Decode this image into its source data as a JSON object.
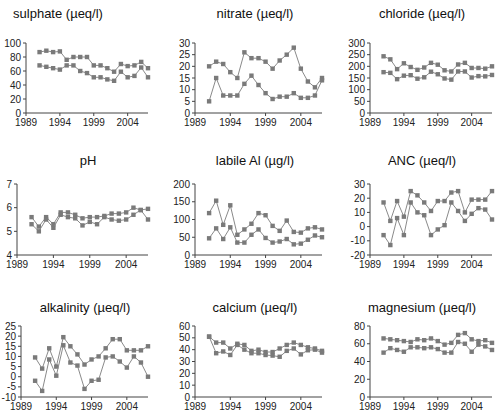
{
  "style": {
    "axis_color": "#444444",
    "line_color": "#8a8a8a",
    "marker_color": "#7a7a7a"
  },
  "chart_data": [
    {
      "id": "sulphate",
      "type": "line",
      "title": "sulphate (µeq/l)",
      "xlabel": "",
      "ylabel": "",
      "xlim": [
        1989,
        2007
      ],
      "ylim": [
        0,
        100
      ],
      "yticks": [
        0,
        20,
        40,
        60,
        80,
        100
      ],
      "xticks": [
        1989,
        1994,
        1999,
        2004
      ],
      "grid": false,
      "x": [
        1991,
        1992,
        1993,
        1994,
        1995,
        1996,
        1997,
        1998,
        1999,
        2000,
        2001,
        2002,
        2003,
        2004,
        2005,
        2006,
        2007
      ],
      "series": [
        {
          "name": "upper",
          "values": [
            87,
            89,
            87,
            88,
            76,
            80,
            80,
            80,
            68,
            68,
            64,
            59,
            70,
            67,
            68,
            73,
            64
          ]
        },
        {
          "name": "lower",
          "values": [
            68,
            66,
            64,
            62,
            68,
            68,
            60,
            57,
            51,
            51,
            48,
            46,
            59,
            51,
            53,
            65,
            51
          ]
        }
      ]
    },
    {
      "id": "nitrate",
      "type": "line",
      "title": "nitrate (µeq/l)",
      "xlabel": "",
      "ylabel": "",
      "xlim": [
        1989,
        2007
      ],
      "ylim": [
        0,
        30
      ],
      "yticks": [
        0,
        5,
        10,
        15,
        20,
        25,
        30
      ],
      "xticks": [
        1989,
        1994,
        1999,
        2004
      ],
      "grid": false,
      "x": [
        1991,
        1992,
        1993,
        1994,
        1995,
        1996,
        1997,
        1998,
        1999,
        2000,
        2001,
        2002,
        2003,
        2004,
        2005,
        2006,
        2007
      ],
      "series": [
        {
          "name": "upper",
          "values": [
            20,
            22,
            21,
            17.5,
            15,
            26,
            23.5,
            23.5,
            22,
            19,
            22.5,
            25,
            28,
            19,
            13.5,
            11,
            15
          ]
        },
        {
          "name": "lower",
          "values": [
            5,
            15,
            7.5,
            7.5,
            7.5,
            12.5,
            16,
            12,
            8.5,
            6,
            7,
            7,
            8.5,
            6.5,
            6.5,
            7.5,
            14
          ]
        }
      ]
    },
    {
      "id": "chloride",
      "type": "line",
      "title": "chloride (µeq/l)",
      "xlabel": "",
      "ylabel": "",
      "xlim": [
        1989,
        2007
      ],
      "ylim": [
        0,
        300
      ],
      "yticks": [
        0,
        50,
        100,
        150,
        200,
        250,
        300
      ],
      "xticks": [
        1989,
        1994,
        1999,
        2004
      ],
      "grid": false,
      "x": [
        1991,
        1992,
        1993,
        1994,
        1995,
        1996,
        1997,
        1998,
        1999,
        2000,
        2001,
        2002,
        2003,
        2004,
        2005,
        2006,
        2007
      ],
      "series": [
        {
          "name": "upper",
          "values": [
            243,
            230,
            188,
            213,
            197,
            185,
            195,
            215,
            207,
            183,
            178,
            208,
            215,
            193,
            193,
            190,
            200
          ]
        },
        {
          "name": "lower",
          "values": [
            175,
            172,
            145,
            160,
            162,
            147,
            153,
            177,
            166,
            148,
            143,
            178,
            178,
            152,
            158,
            157,
            163
          ]
        }
      ]
    },
    {
      "id": "ph",
      "type": "line",
      "title": "pH",
      "xlabel": "",
      "ylabel": "",
      "xlim": [
        1989,
        2007
      ],
      "ylim": [
        4,
        7
      ],
      "yticks": [
        4,
        5,
        6,
        7
      ],
      "xticks": [
        1989,
        1994,
        1999,
        2004
      ],
      "grid": false,
      "x": [
        1991,
        1992,
        1993,
        1994,
        1995,
        1996,
        1997,
        1998,
        1999,
        2000,
        2001,
        2002,
        2003,
        2004,
        2005,
        2006,
        2007
      ],
      "series": [
        {
          "name": "upper",
          "values": [
            5.6,
            5.2,
            5.6,
            5.3,
            5.8,
            5.8,
            5.7,
            5.55,
            5.6,
            5.6,
            5.65,
            5.75,
            5.75,
            5.8,
            6.0,
            5.9,
            5.95
          ]
        },
        {
          "name": "lower",
          "values": [
            5.3,
            5.0,
            5.5,
            5.15,
            5.7,
            5.6,
            5.55,
            5.25,
            5.4,
            5.3,
            5.6,
            5.5,
            5.45,
            5.5,
            5.7,
            5.9,
            5.5
          ]
        }
      ]
    },
    {
      "id": "labile_al",
      "type": "line",
      "title": "labile Al (µg/l)",
      "xlabel": "",
      "ylabel": "",
      "xlim": [
        1989,
        2007
      ],
      "ylim": [
        0,
        200
      ],
      "yticks": [
        0,
        50,
        100,
        150,
        200
      ],
      "xticks": [
        1989,
        1994,
        1999,
        2004
      ],
      "grid": false,
      "x": [
        1991,
        1992,
        1993,
        1994,
        1995,
        1996,
        1997,
        1998,
        1999,
        2000,
        2001,
        2002,
        2003,
        2004,
        2005,
        2006,
        2007
      ],
      "series": [
        {
          "name": "upper",
          "values": [
            118,
            153,
            85,
            140,
            57,
            72,
            88,
            118,
            112,
            82,
            68,
            97,
            65,
            63,
            75,
            78,
            72
          ]
        },
        {
          "name": "lower",
          "values": [
            47,
            75,
            45,
            78,
            35,
            35,
            57,
            72,
            48,
            35,
            38,
            45,
            30,
            32,
            43,
            55,
            50
          ]
        }
      ]
    },
    {
      "id": "anc",
      "type": "line",
      "title": "ANC (µeq/l)",
      "xlabel": "",
      "ylabel": "",
      "xlim": [
        1989,
        2007
      ],
      "ylim": [
        -20,
        30
      ],
      "yticks": [
        -20,
        -10,
        0,
        10,
        20,
        30
      ],
      "xticks": [
        1989,
        1994,
        1999,
        2004
      ],
      "grid": false,
      "x": [
        1991,
        1992,
        1993,
        1994,
        1995,
        1996,
        1997,
        1998,
        1999,
        2000,
        2001,
        2002,
        2003,
        2004,
        2005,
        2006,
        2007
      ],
      "series": [
        {
          "name": "upper",
          "values": [
            17,
            4,
            18,
            7,
            25,
            22,
            17,
            11,
            18,
            18,
            24,
            25,
            10,
            19,
            19,
            19,
            25
          ]
        },
        {
          "name": "lower",
          "values": [
            -6,
            -13,
            6,
            -6,
            17,
            10,
            8,
            -6,
            -2,
            1,
            17,
            11,
            4,
            9,
            13,
            12,
            5
          ]
        }
      ]
    },
    {
      "id": "alkalinity",
      "type": "line",
      "title": "alkalinity (µeq/l)",
      "xlabel": "",
      "ylabel": "",
      "xlim": [
        1989,
        2007
      ],
      "ylim": [
        -10,
        25
      ],
      "yticks": [
        -10,
        -5,
        0,
        5,
        10,
        15,
        20,
        25
      ],
      "xticks": [
        1989,
        1994,
        1999,
        2004
      ],
      "grid": false,
      "x": [
        1991,
        1992,
        1993,
        1994,
        1995,
        1996,
        1997,
        1998,
        1999,
        2000,
        2001,
        2002,
        2003,
        2004,
        2005,
        2006,
        2007
      ],
      "series": [
        {
          "name": "upper",
          "values": [
            9.5,
            4,
            14,
            5,
            19.5,
            15,
            11,
            6,
            8.5,
            10,
            14,
            18.5,
            18.5,
            13,
            13,
            13,
            15
          ]
        },
        {
          "name": "lower",
          "values": [
            -2,
            -7,
            8.5,
            0.5,
            15.5,
            7,
            5.5,
            -6,
            -2,
            -1.5,
            9.5,
            10,
            7.5,
            4.5,
            10,
            7,
            0
          ]
        }
      ]
    },
    {
      "id": "calcium",
      "type": "line",
      "title": "calcium (µeq/l)",
      "xlabel": "",
      "ylabel": "",
      "xlim": [
        1989,
        2007
      ],
      "ylim": [
        0,
        60
      ],
      "yticks": [
        0,
        10,
        20,
        30,
        40,
        50,
        60
      ],
      "xticks": [
        1989,
        1994,
        1999,
        2004
      ],
      "grid": false,
      "x": [
        1991,
        1992,
        1993,
        1994,
        1995,
        1996,
        1997,
        1998,
        1999,
        2000,
        2001,
        2002,
        2003,
        2004,
        2005,
        2006,
        2007
      ],
      "series": [
        {
          "name": "upper",
          "values": [
            51,
            46,
            46,
            41,
            45,
            44,
            39,
            40,
            38,
            38,
            41,
            44,
            46,
            44,
            42,
            41,
            39
          ]
        },
        {
          "name": "lower",
          "values": [
            51,
            37,
            38.5,
            35.5,
            44,
            40,
            37,
            37,
            35.5,
            35,
            34,
            39,
            41,
            36,
            39.5,
            40,
            37.5
          ]
        }
      ]
    },
    {
      "id": "magnesium",
      "type": "line",
      "title": "magnesium (µeq/l)",
      "xlabel": "",
      "ylabel": "",
      "xlim": [
        1989,
        2007
      ],
      "ylim": [
        0,
        80
      ],
      "yticks": [
        0,
        20,
        40,
        60,
        80
      ],
      "xticks": [
        1989,
        1994,
        1999,
        2004
      ],
      "grid": false,
      "x": [
        1991,
        1992,
        1993,
        1994,
        1995,
        1996,
        1997,
        1998,
        1999,
        2000,
        2001,
        2002,
        2003,
        2004,
        2005,
        2006,
        2007
      ],
      "series": [
        {
          "name": "upper",
          "values": [
            66,
            65,
            64,
            63,
            62,
            65,
            64,
            66,
            63,
            59,
            61,
            70,
            72,
            65,
            63,
            64,
            61
          ]
        },
        {
          "name": "lower",
          "values": [
            50,
            55,
            53,
            51,
            56,
            56,
            55,
            56,
            54,
            50,
            50,
            62,
            60,
            51,
            59,
            57,
            53
          ]
        }
      ]
    }
  ],
  "layout": [
    {
      "title_x": 58,
      "title_y": 6,
      "x0": 26,
      "x1": 148,
      "y_top": 43,
      "y_bot": 113
    },
    {
      "title_x": 255,
      "title_y": 6,
      "x0": 195,
      "x1": 322,
      "y_top": 43,
      "y_bot": 113
    },
    {
      "title_x": 422,
      "title_y": 6,
      "x0": 370,
      "x1": 492,
      "y_top": 43,
      "y_bot": 113
    },
    {
      "title_x": 88,
      "title_y": 153,
      "x0": 17,
      "x1": 148,
      "y_top": 184,
      "y_bot": 255
    },
    {
      "title_x": 255,
      "title_y": 153,
      "x0": 195,
      "x1": 322,
      "y_top": 184,
      "y_bot": 255
    },
    {
      "title_x": 422,
      "title_y": 153,
      "x0": 370,
      "x1": 492,
      "y_top": 184,
      "y_bot": 255
    },
    {
      "title_x": 85,
      "title_y": 300,
      "x0": 21,
      "x1": 148,
      "y_top": 326,
      "y_bot": 397
    },
    {
      "title_x": 255,
      "title_y": 300,
      "x0": 195,
      "x1": 322,
      "y_top": 326,
      "y_bot": 397
    },
    {
      "title_x": 422,
      "title_y": 300,
      "x0": 370,
      "x1": 492,
      "y_top": 326,
      "y_bot": 397
    }
  ]
}
